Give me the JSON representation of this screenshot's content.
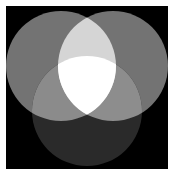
{
  "figure": {
    "title": "",
    "background_color": "#ffffff",
    "plot_background_color": "#000000",
    "width_px": 174,
    "height_px": 176,
    "margin_px": 6
  },
  "chart_data": {
    "type": "diagram",
    "subtype": "venn-3-circle-additive",
    "title": "",
    "subtitle": "",
    "xlabel": "",
    "ylabel": "",
    "grid": false,
    "legend_position": "none",
    "axis_visible": false,
    "tick_labels": [],
    "annotations": [],
    "blend_mode": "additive",
    "canvas": {
      "background": "#000000",
      "width": 162,
      "height": 163
    },
    "sets": [
      {
        "name": "upper-left-circle",
        "label": "",
        "cx": 55,
        "cy": 60,
        "r": 55,
        "fill": "#737373",
        "channel": "red-analog"
      },
      {
        "name": "upper-right-circle",
        "label": "",
        "cx": 107,
        "cy": 60,
        "r": 55,
        "fill": "#737373",
        "channel": "green-analog"
      },
      {
        "name": "lower-center-circle",
        "label": "",
        "cx": 81,
        "cy": 105,
        "r": 55,
        "fill": "#2a2a2a",
        "channel": "blue-analog"
      }
    ],
    "regions": [
      {
        "name": "upper-left-only",
        "members": [
          "upper-left-circle"
        ],
        "color": "#737373",
        "value": 1
      },
      {
        "name": "upper-right-only",
        "members": [
          "upper-right-circle"
        ],
        "color": "#737373",
        "value": 1
      },
      {
        "name": "lower-center-only",
        "members": [
          "lower-center-circle"
        ],
        "color": "#2a2a2a",
        "value": 1
      },
      {
        "name": "upper-pair-overlap",
        "members": [
          "upper-left-circle",
          "upper-right-circle"
        ],
        "color": "#d5d5d5",
        "value": 2
      },
      {
        "name": "left-bottom-overlap",
        "members": [
          "upper-left-circle",
          "lower-center-circle"
        ],
        "color": "#8b8b8b",
        "value": 2
      },
      {
        "name": "right-bottom-overlap",
        "members": [
          "upper-right-circle",
          "lower-center-circle"
        ],
        "color": "#8d8d8d",
        "value": 2
      },
      {
        "name": "triple-overlap",
        "members": [
          "upper-left-circle",
          "upper-right-circle",
          "lower-center-circle"
        ],
        "color": "#ffffff",
        "value": 3
      }
    ],
    "color_levels": {
      "background": "#000000",
      "single": "#737373",
      "single_dim": "#2a2a2a",
      "double_bright": "#d5d5d5",
      "double_mid": "#8b8b8b",
      "triple": "#ffffff"
    }
  }
}
